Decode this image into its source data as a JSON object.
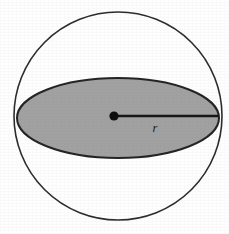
{
  "figure": {
    "name": "sphere-great-circle-diagram",
    "caption": "",
    "background_color": "#fefefe",
    "width": 229,
    "height": 234
  },
  "labels": {
    "radius": "r"
  },
  "colors": {
    "sphere_outline": "#2b2b2b",
    "disk_fill": "#a1a1a1",
    "disk_outline": "#232323",
    "radius_line": "#141414",
    "center_dot": "#0d0d0d",
    "label_text": "#1c1c1c",
    "background": "#fefefe"
  },
  "geometry": {
    "sphere": {
      "shape": "circle",
      "center_x": 118,
      "center_y": 116,
      "radius": 104,
      "stroke_width": 1.6,
      "filled": false
    },
    "equatorial_disk": {
      "shape": "ellipse",
      "center_x": 118,
      "center_y": 118,
      "radius_x": 101,
      "radius_y": 40,
      "stroke_width": 2.0,
      "filled": true
    },
    "radius_segment": {
      "shape": "line",
      "x1": 115,
      "y1": 116,
      "x2": 219,
      "y2": 116,
      "stroke_width": 2.6
    },
    "center_point": {
      "shape": "dot",
      "center_x": 114,
      "center_y": 116,
      "radius": 4.6
    },
    "radius_label_position": {
      "x": 155,
      "y": 132
    }
  }
}
